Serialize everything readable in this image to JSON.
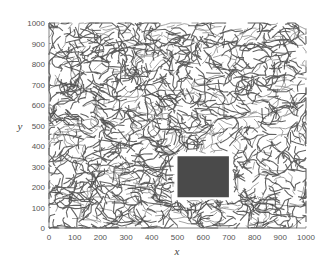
{
  "chart_data": {
    "type": "scatter",
    "title": "",
    "xlabel": "x",
    "ylabel": "y",
    "xlim": [
      0,
      1000
    ],
    "ylim": [
      0,
      1000
    ],
    "xticks": [
      "0",
      "100",
      "200",
      "300",
      "400",
      "500",
      "600",
      "700",
      "800",
      "900",
      "1000"
    ],
    "yticks": [
      "0",
      "100",
      "200",
      "300",
      "400",
      "500",
      "600",
      "700",
      "800",
      "900",
      "1000"
    ],
    "grid": false,
    "legend": null,
    "obstacle": {
      "x": [
        500,
        700
      ],
      "y": [
        150,
        350
      ],
      "color": "#4a4a4a"
    },
    "colors": {
      "network_dark": "#2e2e2e",
      "network_light": "#9a9a9a",
      "axis": "#666666"
    }
  }
}
